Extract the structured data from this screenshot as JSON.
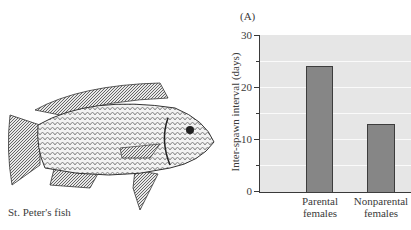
{
  "figure": {
    "panel_label": "(A)",
    "caption": "St. Peter's fish",
    "illustration": "fish-illustration"
  },
  "chart_data": {
    "type": "bar",
    "title": "",
    "categories": [
      "Parental females",
      "Nonparental females"
    ],
    "category_lines": [
      [
        "Parental",
        "females"
      ],
      [
        "Nonparental",
        "females"
      ]
    ],
    "values": [
      24,
      13
    ],
    "xlabel": "",
    "ylabel": "Inter-spawn interval (days)",
    "ylim": [
      0,
      30
    ],
    "yticks": [
      0,
      10,
      20,
      30
    ],
    "ytick_labels": [
      "0",
      "10",
      "20",
      "30"
    ],
    "minor_ticks": [
      5,
      15,
      25
    ],
    "grid": true,
    "legend": null,
    "colors": {
      "bar_fill": "#868686",
      "bar_border": "#3d3d3d",
      "plot_bg": "#e6e6e6",
      "gridline": "#fafafa"
    }
  }
}
